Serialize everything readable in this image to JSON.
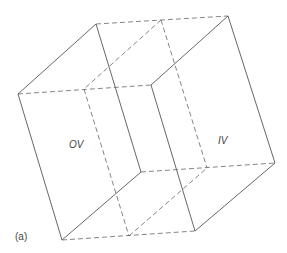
{
  "labels": {
    "left_face": "OV",
    "right_face": "IV",
    "caption": "(a)"
  },
  "colors": {
    "line": "#555555"
  }
}
